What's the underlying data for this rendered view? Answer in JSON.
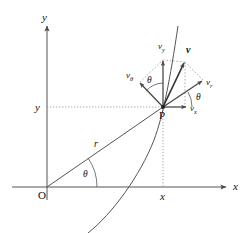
{
  "figure": {
    "background_color": "#ffffff",
    "line_color": "#555555",
    "text_color": "#111111",
    "axes": {
      "x_label": "x",
      "y_label": "y",
      "origin_label": "O"
    },
    "point": {
      "label": "P",
      "x_tick_label": "x",
      "y_tick_label": "y"
    },
    "radius_label": "r",
    "angles": [
      {
        "name": "theta-origin",
        "label": "θ"
      },
      {
        "name": "theta-upper",
        "label": "θ"
      },
      {
        "name": "theta-lower",
        "label": "θ"
      }
    ],
    "vectors": [
      {
        "name": "v",
        "label": "v",
        "style": "bold"
      },
      {
        "name": "v_y",
        "label": "v",
        "sub": "y"
      },
      {
        "name": "v_x",
        "label": "v",
        "sub": "x"
      },
      {
        "name": "v_r",
        "label": "v",
        "sub": "r"
      },
      {
        "name": "v_theta",
        "label": "v",
        "sub": "θ"
      }
    ]
  }
}
